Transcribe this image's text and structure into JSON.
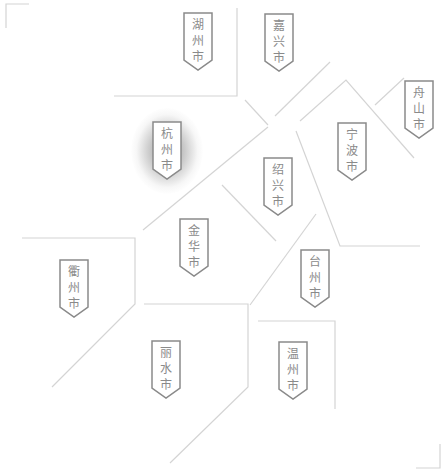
{
  "map": {
    "title": "浙江省",
    "colors": {
      "boundary_line": "#d4d4d4",
      "label_border": "#8a8a8a",
      "label_text": "#8a8a8a",
      "label_fill": "#ffffff",
      "highlight_glow": "#6e6e6e",
      "corner_bracket": "#c8c8c8"
    },
    "selected_city": "杭州市",
    "cities": [
      {
        "name": "湖州市",
        "chars": [
          "湖",
          "州",
          "市"
        ],
        "x": 183,
        "y": 12,
        "selected": false
      },
      {
        "name": "嘉兴市",
        "chars": [
          "嘉",
          "兴",
          "市"
        ],
        "x": 264,
        "y": 13,
        "selected": false
      },
      {
        "name": "舟山市",
        "chars": [
          "舟",
          "山",
          "市"
        ],
        "x": 404,
        "y": 80,
        "selected": false
      },
      {
        "name": "杭州市",
        "chars": [
          "杭",
          "州",
          "市"
        ],
        "x": 152,
        "y": 121,
        "selected": true
      },
      {
        "name": "宁波市",
        "chars": [
          "宁",
          "波",
          "市"
        ],
        "x": 337,
        "y": 122,
        "selected": false
      },
      {
        "name": "绍兴市",
        "chars": [
          "绍",
          "兴",
          "市"
        ],
        "x": 263,
        "y": 157,
        "selected": false
      },
      {
        "name": "金华市",
        "chars": [
          "金",
          "华",
          "市"
        ],
        "x": 179,
        "y": 218,
        "selected": false
      },
      {
        "name": "衢州市",
        "chars": [
          "衢",
          "州",
          "市"
        ],
        "x": 59,
        "y": 259,
        "selected": false
      },
      {
        "name": "台州市",
        "chars": [
          "台",
          "州",
          "市"
        ],
        "x": 300,
        "y": 249,
        "selected": false
      },
      {
        "name": "丽水市",
        "chars": [
          "丽",
          "水",
          "市"
        ],
        "x": 151,
        "y": 340,
        "selected": false
      },
      {
        "name": "温州市",
        "chars": [
          "温",
          "州",
          "市"
        ],
        "x": 278,
        "y": 341,
        "selected": false
      }
    ]
  }
}
